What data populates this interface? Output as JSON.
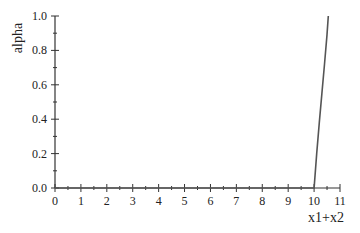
{
  "chart_data": {
    "type": "line",
    "title": "",
    "xlabel": "x1+x2",
    "ylabel": "alpha",
    "xlim": [
      0,
      11
    ],
    "ylim": [
      0.0,
      1.0
    ],
    "x_ticks": [
      "0",
      "1",
      "2",
      "3",
      "4",
      "5",
      "6",
      "7",
      "8",
      "9",
      "10",
      "11"
    ],
    "y_ticks": [
      "0.0",
      "0.2",
      "0.4",
      "0.6",
      "0.8",
      "1.0"
    ],
    "grid": false,
    "legend": null,
    "series": [
      {
        "name": "alpha",
        "color": "#555555",
        "x": [
          0,
          10.0,
          10.1,
          10.2,
          10.3,
          10.4,
          10.5,
          10.55
        ],
        "y": [
          0.0,
          0.0,
          0.2,
          0.38,
          0.55,
          0.72,
          0.89,
          1.0
        ]
      }
    ]
  }
}
